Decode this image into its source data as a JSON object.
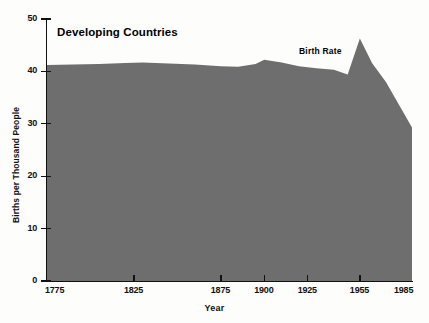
{
  "chart_data": {
    "type": "area",
    "title": "Developing Countries",
    "xlabel": "Year",
    "ylabel": "Births per Thousand People",
    "series_label": "Birth Rate",
    "legend_position": "inline-annotation",
    "grid": false,
    "xlim": [
      1775,
      1985
    ],
    "ylim": [
      0,
      50
    ],
    "yticks": [
      0,
      10,
      20,
      30,
      40,
      50
    ],
    "ytick_labels": [
      "0",
      "10",
      "20",
      "30",
      "40",
      "50"
    ],
    "xticks": [
      1775,
      1825,
      1875,
      1900,
      1925,
      1955,
      1985
    ],
    "xtick_labels": [
      "1775",
      "1825",
      "1875",
      "1900",
      "1925",
      "1955",
      "1985"
    ],
    "fill_color": "#6e6e6e",
    "axis_color": "#111111",
    "background_color": "#fdfdfb",
    "x": [
      1775,
      1790,
      1805,
      1820,
      1830,
      1845,
      1860,
      1875,
      1885,
      1895,
      1900,
      1910,
      1920,
      1930,
      1940,
      1948,
      1955,
      1962,
      1970,
      1985
    ],
    "y": [
      41.2,
      41.3,
      41.4,
      41.6,
      41.7,
      41.5,
      41.3,
      41.0,
      40.9,
      41.4,
      42.2,
      41.7,
      41.0,
      40.6,
      40.3,
      39.4,
      46.3,
      41.6,
      38.0,
      29.3
    ],
    "values": [
      41.2,
      41.3,
      41.4,
      41.6,
      41.7,
      41.5,
      41.3,
      41.0,
      40.9,
      41.4,
      42.2,
      41.7,
      41.0,
      40.6,
      40.3,
      39.4,
      46.3,
      41.6,
      38.0,
      29.3
    ],
    "annotations": [
      {
        "text": "Birth Rate",
        "x": 1910,
        "y": 44.5
      },
      {
        "text": "Developing Countries",
        "x": 1785,
        "y": 48.0
      }
    ]
  },
  "axes": {
    "y_ticks": [
      {
        "label": "50",
        "value": 50
      },
      {
        "label": "40",
        "value": 40
      },
      {
        "label": "30",
        "value": 30
      },
      {
        "label": "20",
        "value": 20
      },
      {
        "label": "10",
        "value": 10
      },
      {
        "label": "0",
        "value": 0
      }
    ],
    "x_ticks": [
      {
        "label": "1775",
        "value": 1775
      },
      {
        "label": "1825",
        "value": 1825
      },
      {
        "label": "1875",
        "value": 1875
      },
      {
        "label": "1900",
        "value": 1900
      },
      {
        "label": "1925",
        "value": 1925
      },
      {
        "label": "1955",
        "value": 1955
      },
      {
        "label": "1985",
        "value": 1985
      }
    ]
  }
}
